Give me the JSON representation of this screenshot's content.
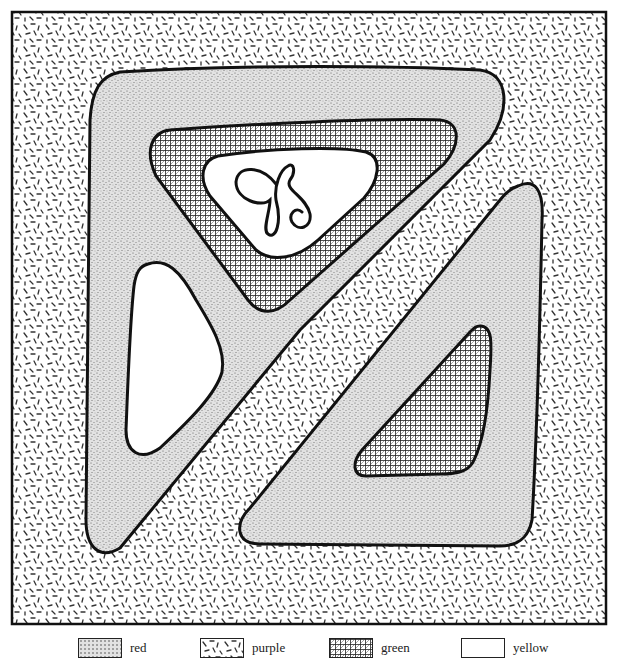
{
  "diagram": {
    "type": "color-by-pattern worksheet",
    "frame": {
      "x": 12,
      "y": 12,
      "width": 594,
      "height": 612
    },
    "regions": [
      {
        "id": "background",
        "pattern": "purple",
        "description": "dashed-stroke fill covering the whole framed area"
      },
      {
        "id": "upper-left-band",
        "pattern": "red",
        "description": "large rounded triangle, stippled"
      },
      {
        "id": "upper-green-triangle",
        "pattern": "green",
        "description": "cross-hatched inverted triangle"
      },
      {
        "id": "monogram-window",
        "pattern": "yellow",
        "description": "white rounded shape containing a script monogram"
      },
      {
        "id": "left-white-triangle",
        "pattern": "yellow",
        "description": "white rounded triangle on left"
      },
      {
        "id": "diagonal-stripe",
        "pattern": "purple",
        "description": "diagonal dashed band separating upper-left and lower-right shapes"
      },
      {
        "id": "lower-right-band",
        "pattern": "red",
        "description": "stippled rounded triangle on lower right"
      },
      {
        "id": "lower-green-triangle",
        "pattern": "green",
        "description": "cross-hatched triangle inside lower-right band"
      }
    ],
    "monogram": "JS"
  },
  "legend": {
    "items": [
      {
        "label": "red",
        "pattern": "stipple"
      },
      {
        "label": "purple",
        "pattern": "dashes"
      },
      {
        "label": "green",
        "pattern": "crosshatch"
      },
      {
        "label": "yellow",
        "pattern": "blank"
      }
    ]
  }
}
